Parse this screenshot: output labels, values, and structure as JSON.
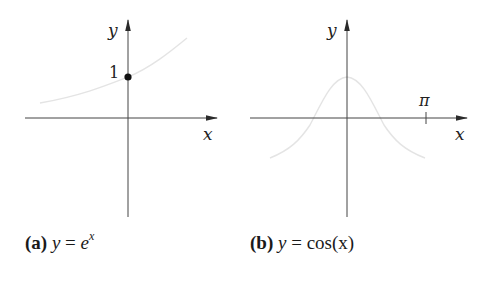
{
  "figures": [
    {
      "id": "a",
      "caption_tag": "(a)",
      "caption_lhs": "y",
      "caption_eq": " = ",
      "caption_base": "e",
      "caption_exp": "x",
      "x_axis_label": "x",
      "y_axis_label": "y",
      "marked_point_label": "1",
      "function": "exp"
    },
    {
      "id": "b",
      "caption_tag": "(b)",
      "caption_lhs": "y",
      "caption_eq": " = ",
      "caption_rhs_fn": "cos",
      "caption_rhs_arg": "(x)",
      "x_axis_label": "x",
      "y_axis_label": "y",
      "tick_label": "π",
      "function": "cos"
    }
  ],
  "colors": {
    "axis": "#3a3a3a",
    "curve": "#e6e6e6",
    "point": "#111111"
  }
}
